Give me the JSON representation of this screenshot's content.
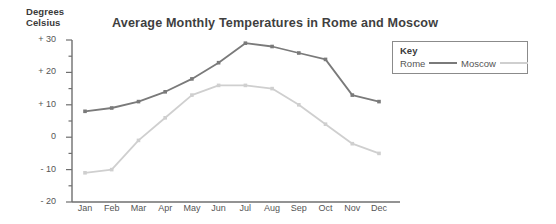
{
  "chart_data": {
    "type": "line",
    "title": "Average Monthly Temperatures in Rome and Moscow",
    "ylabel_line1": "Degrees",
    "ylabel_line2": "Celsius",
    "xlabel": "",
    "categories": [
      "Jan",
      "Feb",
      "Mar",
      "Apr",
      "May",
      "Jun",
      "Jul",
      "Aug",
      "Sep",
      "Oct",
      "Nov",
      "Dec"
    ],
    "ylim": [
      -20,
      30
    ],
    "ytick_labels": [
      "+ 30",
      "+ 20",
      "+ 10",
      "0",
      "- 10",
      "- 20"
    ],
    "ytick_values": [
      30,
      20,
      10,
      0,
      -10,
      -20
    ],
    "minor_tick_step": 5,
    "grid": false,
    "legend_position": "top-right inside",
    "series": [
      {
        "name": "Rome",
        "color": "#7a7a7a",
        "values": [
          8,
          9,
          11,
          14,
          18,
          23,
          29,
          28,
          26,
          24,
          13,
          11
        ]
      },
      {
        "name": "Moscow",
        "color": "#cfcfcf",
        "values": [
          -11,
          -10,
          -1,
          6,
          13,
          16,
          16,
          15,
          10,
          4,
          -2,
          -5
        ]
      }
    ]
  },
  "legend": {
    "title": "Key",
    "entries": [
      {
        "label": "Rome",
        "color": "#7a7a7a"
      },
      {
        "label": "Moscow",
        "color": "#cfcfcf"
      }
    ]
  },
  "axes": {
    "axis_color": "#6f6f6f"
  }
}
